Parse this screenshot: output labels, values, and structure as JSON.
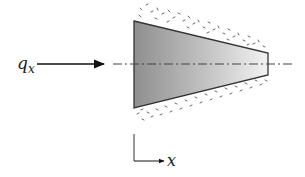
{
  "diagram": {
    "type": "heat-conduction-fin",
    "heat_flux_label": "q",
    "heat_flux_subscript": "x",
    "axis_label": "x",
    "colors": {
      "body_dark": "#8f8f8f",
      "body_light": "#f2f2f2",
      "outline": "#333333",
      "arrow": "#111111",
      "insulation_specks": "#555555",
      "centerline": "#444444"
    },
    "shape": {
      "left_x": 134,
      "left_top_y": 21,
      "left_bottom_y": 108,
      "right_x": 268,
      "right_top_y": 53,
      "right_bottom_y": 75,
      "centerline_y": 64
    }
  }
}
